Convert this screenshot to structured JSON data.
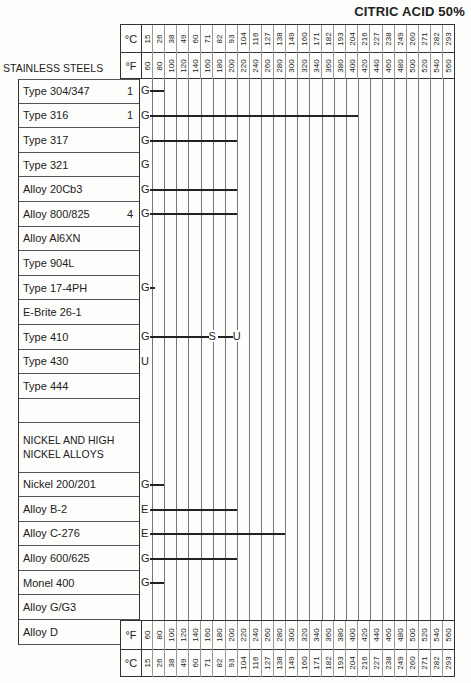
{
  "title": "CITRIC ACID 50%",
  "section_label": "STAINLESS STEELS",
  "units": {
    "c": "°C",
    "f": "°F"
  },
  "temps_c": [
    "15",
    "26",
    "38",
    "49",
    "60",
    "71",
    "82",
    "93",
    "104",
    "116",
    "127",
    "138",
    "149",
    "160",
    "171",
    "182",
    "193",
    "204",
    "216",
    "227",
    "238",
    "249",
    "260",
    "271",
    "282",
    "293"
  ],
  "temps_f": [
    "60",
    "80",
    "100",
    "120",
    "140",
    "160",
    "180",
    "200",
    "220",
    "240",
    "260",
    "280",
    "300",
    "320",
    "340",
    "360",
    "380",
    "400",
    "420",
    "440",
    "460",
    "480",
    "500",
    "520",
    "540",
    "560"
  ],
  "rows": [
    {
      "name": "Type 304/347",
      "note": "1",
      "rating": "G",
      "bar_to_f": 80
    },
    {
      "name": "Type 316",
      "note": "1",
      "rating": "G",
      "bar_to_f": 400
    },
    {
      "name": "Type 317",
      "note": "",
      "rating": "G",
      "bar_to_f": 200
    },
    {
      "name": "Type 321",
      "note": "",
      "rating": "G",
      "bar_to_f": null
    },
    {
      "name": "Alloy 20Cb3",
      "note": "",
      "rating": "G",
      "bar_to_f": 200
    },
    {
      "name": "Alloy 800/825",
      "note": "4",
      "rating": "G",
      "bar_to_f": 200
    },
    {
      "name": "Alloy Al6XN",
      "note": "",
      "rating": "",
      "bar_to_f": null
    },
    {
      "name": "Type 904L",
      "note": "",
      "rating": "",
      "bar_to_f": null
    },
    {
      "name": "Type 17-4PH",
      "note": "",
      "rating": "G",
      "bar_to_f": 65
    },
    {
      "name": "E-Brite 26-1",
      "note": "",
      "rating": "",
      "bar_to_f": null
    },
    {
      "name": "Type 410",
      "note": "",
      "rating": "G",
      "bar_to_f": null,
      "transitions": [
        {
          "rating": "S",
          "at_f": 160
        },
        {
          "rating": "U",
          "at_f": 200
        }
      ]
    },
    {
      "name": "Type 430",
      "note": "",
      "rating": "U",
      "bar_to_f": null
    },
    {
      "name": "Type 444",
      "note": "",
      "rating": "",
      "bar_to_f": null
    },
    {
      "name": "",
      "note": "",
      "rating": "",
      "bar_to_f": null
    },
    {
      "name": "NICKEL AND HIGH NICKEL ALLOYS",
      "note": "",
      "rating": "",
      "bar_to_f": null,
      "header": true
    },
    {
      "name": "Nickel 200/201",
      "note": "",
      "rating": "G",
      "bar_to_f": 80
    },
    {
      "name": "Alloy B-2",
      "note": "",
      "rating": "E",
      "bar_to_f": 200
    },
    {
      "name": "Alloy C-276",
      "note": "",
      "rating": "E",
      "bar_to_f": 280
    },
    {
      "name": "Alloy 600/625",
      "note": "",
      "rating": "G",
      "bar_to_f": 200
    },
    {
      "name": "Monel 400",
      "note": "",
      "rating": "G",
      "bar_to_f": 80
    },
    {
      "name": "Alloy G/G3",
      "note": "",
      "rating": "",
      "bar_to_f": null
    },
    {
      "name": "Alloy D",
      "note": "",
      "rating": "E",
      "bar_to_f": 200
    }
  ],
  "chart_data": {
    "type": "table",
    "title": "CITRIC ACID 50%",
    "xlabel": "Temperature (°F / °C)",
    "x_f": [
      60,
      80,
      100,
      120,
      140,
      160,
      180,
      200,
      220,
      240,
      260,
      280,
      300,
      320,
      340,
      360,
      380,
      400,
      420,
      440,
      460,
      480,
      500,
      520,
      540,
      560
    ],
    "x_c": [
      15,
      26,
      38,
      49,
      60,
      71,
      82,
      93,
      104,
      116,
      127,
      138,
      149,
      160,
      171,
      182,
      193,
      204,
      216,
      227,
      238,
      249,
      260,
      271,
      282,
      293
    ],
    "legend": {
      "E": "Excellent",
      "G": "Good",
      "S": "Satisfactory",
      "U": "Unsatisfactory"
    },
    "series": [
      {
        "name": "Type 304/347",
        "note": "1",
        "segments": [
          {
            "rating": "G",
            "from_f": 60,
            "to_f": 80
          }
        ]
      },
      {
        "name": "Type 316",
        "note": "1",
        "segments": [
          {
            "rating": "G",
            "from_f": 60,
            "to_f": 400
          }
        ]
      },
      {
        "name": "Type 317",
        "segments": [
          {
            "rating": "G",
            "from_f": 60,
            "to_f": 200
          }
        ]
      },
      {
        "name": "Type 321",
        "segments": [
          {
            "rating": "G",
            "from_f": 60,
            "to_f": 60
          }
        ]
      },
      {
        "name": "Alloy 20Cb3",
        "segments": [
          {
            "rating": "G",
            "from_f": 60,
            "to_f": 200
          }
        ]
      },
      {
        "name": "Alloy 800/825",
        "note": "4",
        "segments": [
          {
            "rating": "G",
            "from_f": 60,
            "to_f": 200
          }
        ]
      },
      {
        "name": "Alloy Al6XN",
        "segments": []
      },
      {
        "name": "Type 904L",
        "segments": []
      },
      {
        "name": "Type 17-4PH",
        "segments": [
          {
            "rating": "G",
            "from_f": 60,
            "to_f": 65
          }
        ]
      },
      {
        "name": "E-Brite 26-1",
        "segments": []
      },
      {
        "name": "Type 410",
        "segments": [
          {
            "rating": "G",
            "from_f": 60,
            "to_f": 160
          },
          {
            "rating": "S",
            "from_f": 160,
            "to_f": 200
          },
          {
            "rating": "U",
            "from_f": 200,
            "to_f": 200
          }
        ]
      },
      {
        "name": "Type 430",
        "segments": [
          {
            "rating": "U",
            "from_f": 60,
            "to_f": 60
          }
        ]
      },
      {
        "name": "Type 444",
        "segments": []
      },
      {
        "name": "Nickel 200/201",
        "segments": [
          {
            "rating": "G",
            "from_f": 60,
            "to_f": 80
          }
        ]
      },
      {
        "name": "Alloy B-2",
        "segments": [
          {
            "rating": "E",
            "from_f": 60,
            "to_f": 200
          }
        ]
      },
      {
        "name": "Alloy C-276",
        "segments": [
          {
            "rating": "E",
            "from_f": 60,
            "to_f": 280
          }
        ]
      },
      {
        "name": "Alloy 600/625",
        "segments": [
          {
            "rating": "G",
            "from_f": 60,
            "to_f": 200
          }
        ]
      },
      {
        "name": "Monel 400",
        "segments": [
          {
            "rating": "G",
            "from_f": 60,
            "to_f": 80
          }
        ]
      },
      {
        "name": "Alloy G/G3",
        "segments": []
      },
      {
        "name": "Alloy D",
        "segments": [
          {
            "rating": "E",
            "from_f": 60,
            "to_f": 200
          }
        ]
      }
    ],
    "grid": true
  }
}
